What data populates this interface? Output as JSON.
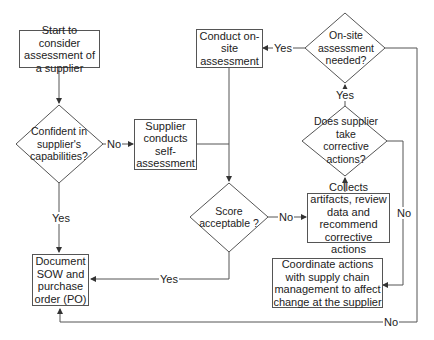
{
  "diagram": {
    "nodes": {
      "start": "Start to consider assessment of a supplier",
      "confident": "Confident in supplier's capabilities?",
      "self_assess": "Supplier conducts self-assessment",
      "onsite": "Conduct on-site assessment",
      "onsite_needed": "On-site assessment needed?",
      "corrective_q": "Does supplier take corrective actions?",
      "score": "Score acceptable ?",
      "collect": "Collects artifacts, review data and recommend corrective actions",
      "coordinate": "Coordinate actions with supply chain management to affect change at the supplier",
      "document": "Document SOW and purchase order (PO)"
    },
    "labels": {
      "confident_no": "No",
      "confident_yes": "Yes",
      "onsite_yes": "Yes",
      "corrective_yes": "Yes",
      "score_no": "No",
      "score_yes": "Yes",
      "corrective_no": "No",
      "onsite_no": "No"
    }
  }
}
